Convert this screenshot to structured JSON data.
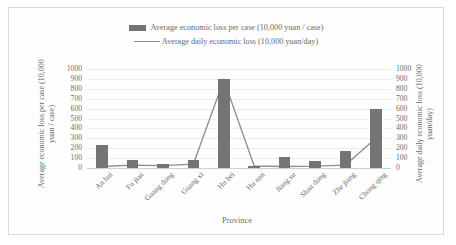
{
  "chart_data": {
    "type": "bar",
    "title": "",
    "xlabel": "Province",
    "ylabel": "Average economic loss per case (10,000 yuan / case)",
    "y2label": "Average daily economic loss (10,000 yuan/day)",
    "categories": [
      "An hui",
      "Fu jian",
      "Guang dong",
      "Guang xi",
      "Hu bei",
      "Hu nan",
      "Jiang su",
      "Shan dong",
      "Zhe jiang",
      "Chong qing"
    ],
    "ylim": [
      0,
      1000
    ],
    "y2lim": [
      0,
      1000
    ],
    "yticks": [
      0,
      100,
      200,
      300,
      400,
      500,
      600,
      700,
      800,
      900,
      1000
    ],
    "y2ticks": [
      0,
      100,
      200,
      300,
      400,
      500,
      600,
      700,
      800,
      900,
      1000
    ],
    "grid": true,
    "legend_position": "top-center",
    "series": [
      {
        "name": "Average economic loss per case (10,000 yuan / case)",
        "type": "bar",
        "axis": "left",
        "color": "#747474",
        "values": [
          235,
          80,
          40,
          85,
          900,
          20,
          110,
          75,
          175,
          600
        ]
      },
      {
        "name": "Average daily economic loss (10,000 yuan/day)",
        "type": "line",
        "axis": "right",
        "color": "#8c8c8c",
        "values": [
          15,
          30,
          25,
          40,
          890,
          20,
          15,
          18,
          30,
          300
        ]
      }
    ]
  },
  "legend": {
    "bar_label": "Average economic loss per case (10,000 yuan / case)",
    "line_label": "Average daily economic loss (10,000 yuan/day)"
  },
  "axes": {
    "left_title": "Average economic loss per case (10,000 yuan / case)",
    "right_title": "Average daily economic loss (10,000 yuan/day)",
    "x_title": "Province"
  }
}
